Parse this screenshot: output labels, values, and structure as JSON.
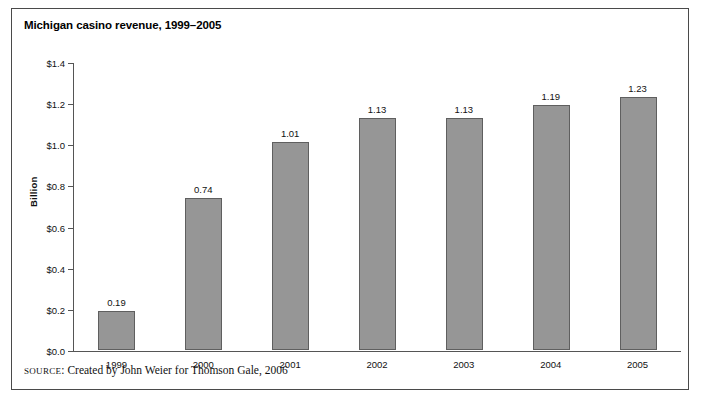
{
  "figure": {
    "title": "Michigan casino revenue, 1999–2005",
    "source_label": "SOURCE",
    "source_text": ": Created by John Weier for Thomson Gale, 2006",
    "border_color": "#4a4a4a",
    "background_color": "#ffffff"
  },
  "chart_data": {
    "type": "bar",
    "title": "Michigan casino revenue, 1999–2005",
    "xlabel": "",
    "ylabel": "Billion",
    "categories": [
      "1999",
      "2000",
      "2001",
      "2002",
      "2003",
      "2004",
      "2005"
    ],
    "values": [
      0.19,
      0.74,
      1.01,
      1.13,
      1.13,
      1.19,
      1.23
    ],
    "value_labels": [
      "0.19",
      "0.74",
      "1.01",
      "1.13",
      "1.13",
      "1.19",
      "1.23"
    ],
    "ylim": [
      0.0,
      1.4
    ],
    "ytick_values": [
      0.0,
      0.2,
      0.4,
      0.6,
      0.8,
      1.0,
      1.2,
      1.4
    ],
    "ytick_labels": [
      "$0.0",
      "$0.2",
      "$0.4",
      "$0.6",
      "$0.8",
      "$1.0",
      "$1.2",
      "$1.4"
    ],
    "grid": false,
    "legend": false,
    "bar_color": "#969696",
    "bar_border_color": "#5f5f5f",
    "axis_color": "#555555"
  }
}
